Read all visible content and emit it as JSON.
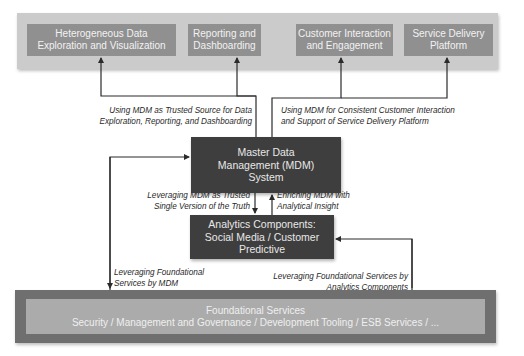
{
  "top_layer": {
    "boxes": [
      {
        "label_line1": "Heterogeneous Data",
        "label_line2": "Exploration and Visualization"
      },
      {
        "label_line1": "Reporting and",
        "label_line2": "Dashboarding"
      },
      {
        "label_line1": "Customer Interaction",
        "label_line2": "and Engagement"
      },
      {
        "label_line1": "Service Delivery",
        "label_line2": "Platform"
      }
    ]
  },
  "mdm": {
    "line1": "Master Data",
    "line2": "Management (MDM)",
    "line3": "System"
  },
  "analytics": {
    "line1": "Analytics Components:",
    "line2": "Social Media / Customer",
    "line3": "Predictive"
  },
  "foundation": {
    "title": "Foundational Services",
    "subtitle": "Security / Management and Governance / Development Tooling / ESB Services / ..."
  },
  "edge_labels": {
    "trusted_source": {
      "line1": "Using MDM as Trusted Source for Data",
      "line2": "Exploration, Reporting, and Dashboarding"
    },
    "consistent_interaction": {
      "line1": "Using MDM for Consistent Customer Interaction",
      "line2": "and Support of Service Delivery Platform"
    },
    "single_version": {
      "line1": "Leveraging MDM as Trusted",
      "line2": "Single Version of the Truth"
    },
    "enriching": {
      "line1": "Enriching MDM with",
      "line2": "Analytical Insight"
    },
    "foundational_by_mdm": {
      "line1": "Leveraging Foundational",
      "line2": "Services by MDM"
    },
    "foundational_by_analytics": {
      "line1": "Leveraging Foundational Services by",
      "line2": "Analytics Components"
    }
  },
  "colors": {
    "top_frame": "#cbcbcb",
    "top_box": "#909090",
    "dark_box": "#3e3e3e",
    "bottom_frame": "#6f6f6f",
    "bottom_inner": "#ababab",
    "connector": "#2b2b2b"
  }
}
